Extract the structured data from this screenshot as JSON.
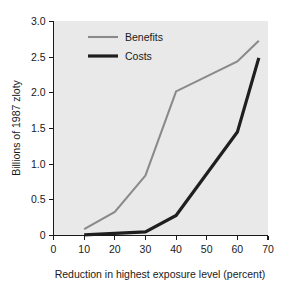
{
  "chart_data": {
    "type": "line",
    "title": "",
    "xlabel": "Reduction in highest exposure level (percent)",
    "ylabel": "Billions of 1987 zloty",
    "xlim": [
      0,
      70
    ],
    "ylim": [
      0,
      3.0
    ],
    "xticks": [
      0,
      10,
      20,
      30,
      40,
      50,
      60,
      70
    ],
    "xtick_labels": [
      "0",
      "10",
      "20",
      "30",
      "40",
      "50",
      "60",
      "70"
    ],
    "yticks": [
      0,
      0.5,
      1.0,
      1.5,
      2.0,
      2.5,
      3.0
    ],
    "ytick_labels": [
      "0",
      "0.5",
      "1.0",
      "1.5",
      "2.0",
      "2.5",
      "3.0"
    ],
    "grid": false,
    "legend_position": "upper-left-inside",
    "plot_background": "#e9e9e9",
    "series": [
      {
        "name": "Benefits",
        "color": "#8a8a8a",
        "width": 2.1,
        "x": [
          10,
          20,
          30,
          40,
          60,
          67
        ],
        "values": [
          0.09,
          0.33,
          0.84,
          2.02,
          2.44,
          2.73
        ]
      },
      {
        "name": "Costs",
        "color": "#1f1f1f",
        "width": 3.2,
        "x": [
          10,
          20,
          30,
          40,
          60,
          67
        ],
        "values": [
          0.01,
          0.03,
          0.05,
          0.28,
          1.45,
          2.49
        ]
      }
    ]
  },
  "legend": {
    "items": [
      {
        "label": "Benefits",
        "color": "#8a8a8a",
        "width": 2.1
      },
      {
        "label": "Costs",
        "color": "#1f1f1f",
        "width": 3.2
      }
    ]
  }
}
